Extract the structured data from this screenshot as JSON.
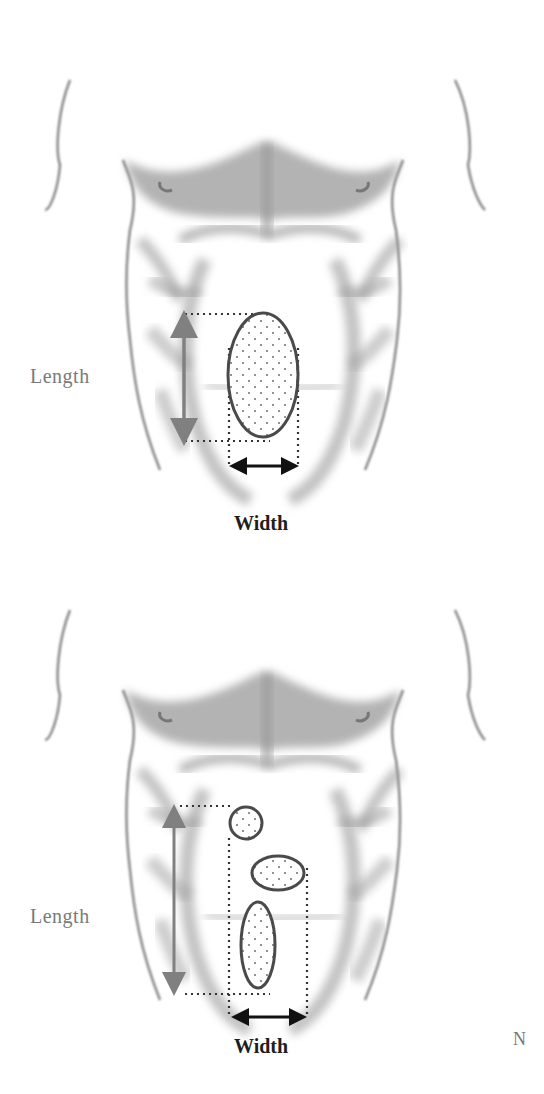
{
  "figures": [
    {
      "id": "single-lesion",
      "length_label": "Length",
      "width_label": "Width",
      "lesions": [
        {
          "shape": "ellipse",
          "cx": 263,
          "cy": 375,
          "rx": 35,
          "ry": 62
        }
      ]
    },
    {
      "id": "multiple-lesions",
      "length_label": "Length",
      "width_label": "Width",
      "lesions": [
        {
          "shape": "circle",
          "cx": 246,
          "cy": 823,
          "rx": 16,
          "ry": 16
        },
        {
          "shape": "ellipse",
          "cx": 278,
          "cy": 873,
          "rx": 26,
          "ry": 17
        },
        {
          "shape": "ellipse",
          "cx": 258,
          "cy": 945,
          "rx": 17,
          "ry": 43
        }
      ]
    }
  ],
  "stray_mark": "N",
  "colors": {
    "torso_shading": "#9a9a9a",
    "length_arrow": "#808080",
    "width_arrow": "#111111",
    "lesion_outline": "#4a4a4a",
    "dotted_guides": "#333333"
  }
}
